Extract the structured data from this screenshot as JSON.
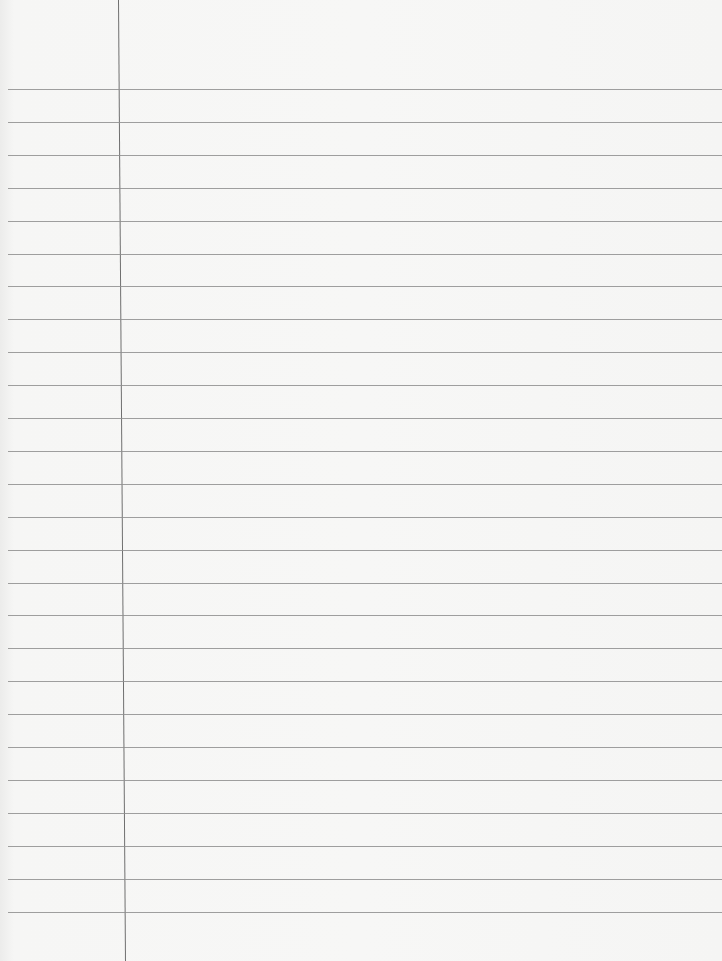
{
  "paper": {
    "type": "lined-notebook-page",
    "background_color": "#f6f6f5",
    "rule_color": "#8e8e8e",
    "margin_color": "#6f6f6f",
    "rule_count": 26,
    "first_rule_y": 89,
    "rule_spacing": 32.9,
    "margin_x_top": 118,
    "margin_x_bottom": 125,
    "text": ""
  }
}
